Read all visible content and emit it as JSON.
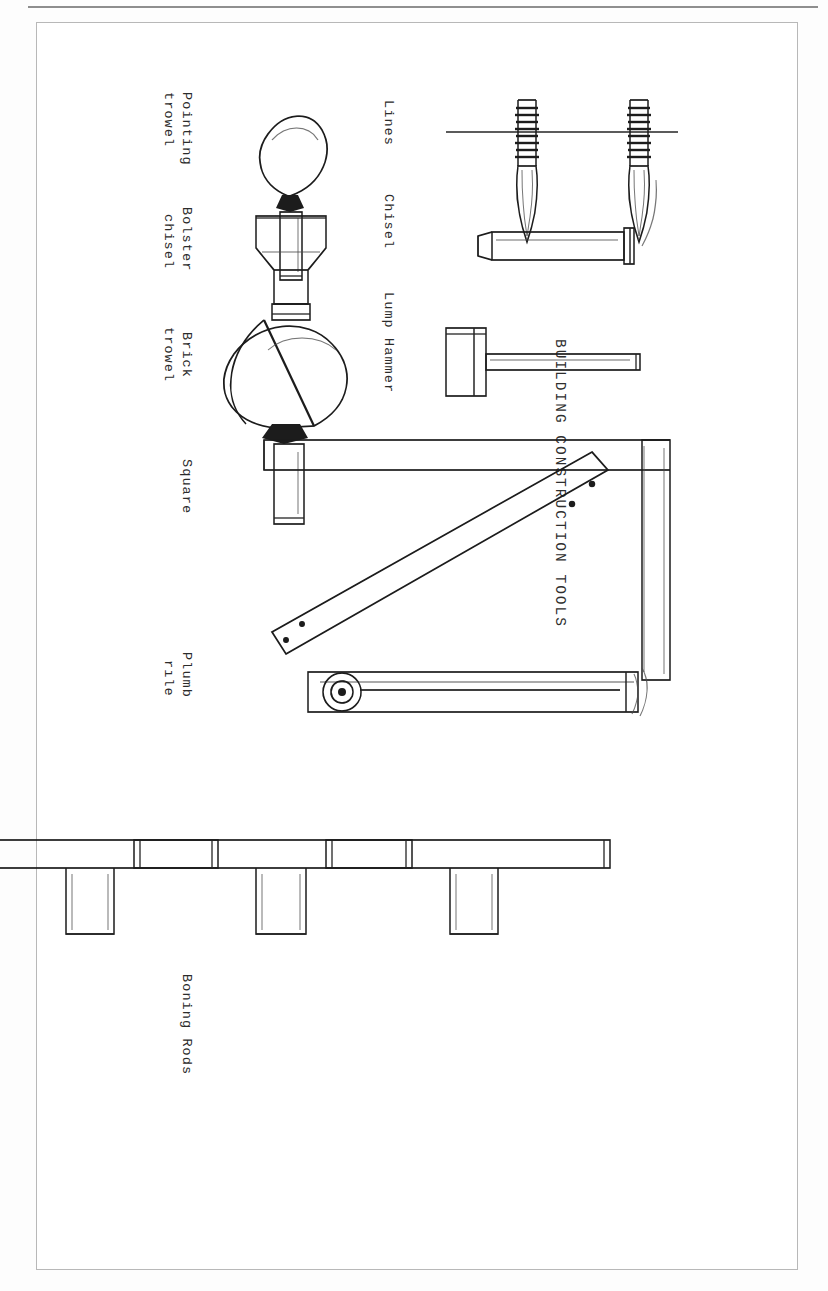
{
  "document": {
    "title": "BUILDING CONSTRUCTION TOOLS",
    "orientation": "landscape-rotated-90",
    "page_style": "photocopied hand drawing with typewriter captions",
    "border_color": "#b8b8b8",
    "ink_color": "#1c1c1c",
    "paper_color": "#ffffff"
  },
  "captions": {
    "row_top": [
      {
        "name": "lines",
        "text": "Lines"
      },
      {
        "name": "chisel",
        "text": "Chisel"
      },
      {
        "name": "lump-hammer",
        "text": "Lump Hammer"
      }
    ],
    "row_bottom": [
      {
        "name": "pointing-trowel",
        "line1": "Pointing",
        "line2": "trowel"
      },
      {
        "name": "bolster-chisel",
        "line1": "Bolster",
        "line2": "chisel"
      },
      {
        "name": "brick-trowel",
        "line1": "Brick",
        "line2": "trowel"
      },
      {
        "name": "square",
        "line1": "Square",
        "line2": ""
      },
      {
        "name": "plumb-rule",
        "line1": "Plumb",
        "line2": "rıle"
      },
      {
        "name": "boning-rods",
        "line1": "Boning Rods",
        "line2": ""
      }
    ]
  },
  "figures": [
    {
      "name": "line-pin-upper",
      "label": "Lines",
      "count": 2,
      "description": "two coiled brick line pins with threaded shafts and pointed ends"
    },
    {
      "name": "chisel",
      "label": "Chisel",
      "description": "straight cold chisel, long rectangular shaft with struck head"
    },
    {
      "name": "lump-hammer",
      "label": "Lump Hammer",
      "description": "club hammer with rectangular head and long handle"
    },
    {
      "name": "pointing-trowel",
      "label": "Pointing trowel",
      "description": "small heart shaped blade with tang, ferrule and handle"
    },
    {
      "name": "bolster-chisel",
      "label": "Bolster chisel",
      "description": "wide bladed bolster with flared cutting edge"
    },
    {
      "name": "brick-trowel",
      "label": "Brick trowel",
      "description": "large triangular trowel blade with shank and handle"
    },
    {
      "name": "square",
      "label": "Square",
      "description": "large timber builders square, two arms with diagonal brace"
    },
    {
      "name": "plumb-rule",
      "label": "Plumb rule",
      "description": "long straight rule with plumb bob in recess at lower end"
    },
    {
      "name": "boning-rod-1",
      "label": "Boning Rods",
      "description": "T shaped boning rod"
    },
    {
      "name": "boning-rod-2",
      "label": "Boning Rods",
      "description": "T shaped boning rod"
    },
    {
      "name": "boning-rod-3",
      "label": "Boning Rods",
      "description": "T shaped boning rod"
    }
  ]
}
